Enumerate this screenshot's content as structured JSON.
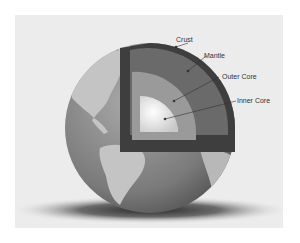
{
  "figure": {
    "labels": {
      "crust": "Crust",
      "mantle": "Mantle",
      "outer_core": "Outer Core",
      "inner_core": "Inner Core"
    }
  },
  "colors": {
    "background": "#ffffff",
    "card": "#ececec",
    "ocean": "#7c7c7c",
    "land": "#c4c4c4",
    "crust": "#3e3e3e",
    "mantle": "#6a6a6a",
    "outer_core": "#9a9a9a",
    "inner_core": "#e6e6e6"
  }
}
